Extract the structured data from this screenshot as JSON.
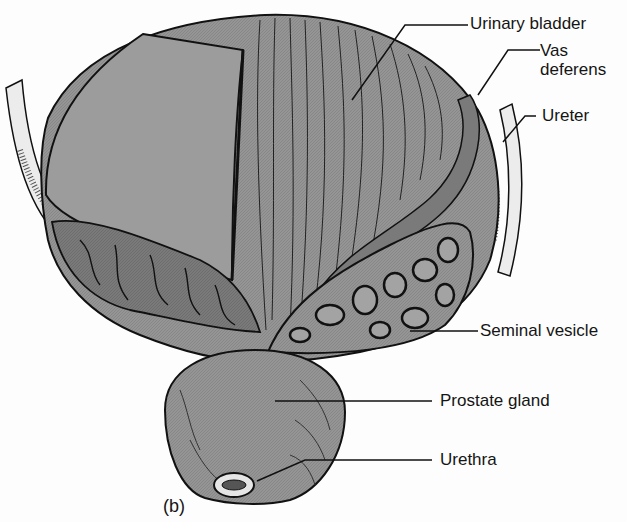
{
  "figure": {
    "panel_label": "(b)"
  },
  "labels": [
    {
      "id": "urinary-bladder",
      "text": "Urinary bladder"
    },
    {
      "id": "vas-deferens",
      "text": "Vas\ndeferens"
    },
    {
      "id": "ureter",
      "text": "Ureter"
    },
    {
      "id": "seminal-vesicle",
      "text": "Seminal vesicle"
    },
    {
      "id": "prostate-gland",
      "text": "Prostate gland"
    },
    {
      "id": "urethra",
      "text": "Urethra"
    }
  ],
  "colors": {
    "tissue_fill": "#8f8f8f",
    "tissue_light": "#a6a6a6",
    "tissue_dark": "#6e6e6e",
    "outline": "#111111",
    "background": "#fdfdfd",
    "ureter_fill": "#e8e8e8"
  }
}
